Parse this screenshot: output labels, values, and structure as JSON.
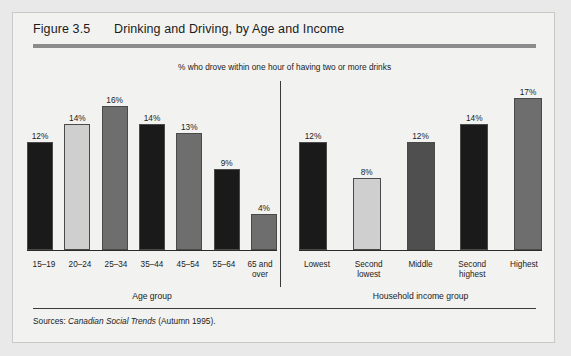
{
  "figure": {
    "number": "Figure 3.5",
    "title": "Drinking and Driving, by Age and Income",
    "subtitle": "% who drove within one hour of having two or more drinks",
    "source_prefix": "Sources:",
    "source_italic": "Canadian Social Trends",
    "source_suffix": "(Autumn 1995)."
  },
  "colors": {
    "dark": "#1a1a1a",
    "light": "#cfcfcf",
    "medium": "#6e6e6e",
    "medium_dark": "#4f4f4f",
    "panel_bg": "#f2f2f0",
    "page_bg": "#e9e9e9",
    "rule": "#8c8c8c",
    "axis": "#2b2b2b"
  },
  "chart_data": [
    {
      "type": "bar",
      "title": "Drinking and Driving, by Age",
      "subtitle": "% who drove within one hour of having two or more drinks",
      "xlabel": "Age group",
      "ylabel": "",
      "ylim": [
        0,
        18
      ],
      "grid": false,
      "legend": "none",
      "categories": [
        "15–19",
        "20–24",
        "25–34",
        "35–44",
        "45–54",
        "55–64",
        "65 and over"
      ],
      "values": [
        12,
        14,
        16,
        14,
        13,
        9,
        4
      ],
      "labels": [
        "12%",
        "14%",
        "16%",
        "14%",
        "13%",
        "9%",
        "4%"
      ],
      "bar_colors": [
        "#1a1a1a",
        "#cfcfcf",
        "#6e6e6e",
        "#1a1a1a",
        "#6e6e6e",
        "#1a1a1a",
        "#6e6e6e"
      ]
    },
    {
      "type": "bar",
      "title": "Drinking and Driving, by Income",
      "subtitle": "% who drove within one hour of having two or more drinks",
      "xlabel": "Household income group",
      "ylabel": "",
      "ylim": [
        0,
        18
      ],
      "grid": false,
      "legend": "none",
      "categories": [
        "Lowest",
        "Second lowest",
        "Middle",
        "Second highest",
        "Highest"
      ],
      "values": [
        12,
        8,
        12,
        14,
        17
      ],
      "labels": [
        "12%",
        "8%",
        "12%",
        "14%",
        "17%"
      ],
      "bar_colors": [
        "#1a1a1a",
        "#cfcfcf",
        "#4f4f4f",
        "#1a1a1a",
        "#6e6e6e"
      ]
    }
  ]
}
